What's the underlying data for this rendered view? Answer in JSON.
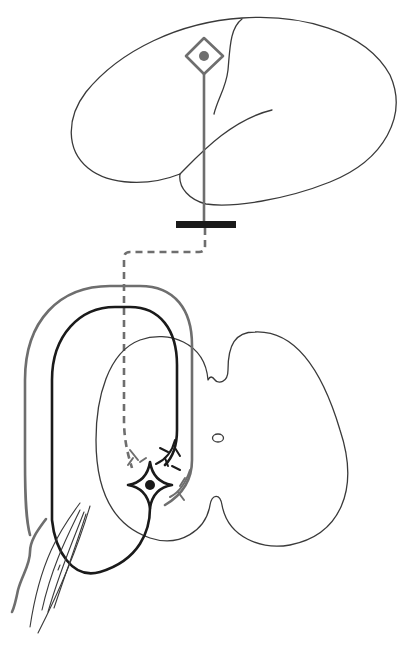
{
  "figure": {
    "description": "Schematic of motor pathway: upper motor neuron in brain, descending tract through synapse bar, spinal cord cross-section with lower motor neuron, sensory loop, and muscle",
    "colors": {
      "outline": "#3a3a3a",
      "gray_pathway": "#6e6e6e",
      "black_pathway": "#1a1a1a",
      "synapse_bar": "#1a1a1a",
      "background": "#ffffff"
    }
  },
  "elements": {
    "brain": {
      "label": "brain-outline"
    },
    "upper_neuron": {
      "label": "upper-motor-neuron",
      "shape": "diamond"
    },
    "descending_axon": {
      "label": "descending-axon"
    },
    "synapse_bar": {
      "label": "decussation-bar"
    },
    "dashed_tract": {
      "label": "dashed-descending-tract"
    },
    "spinal_cord": {
      "label": "spinal-cord-cross-section"
    },
    "central_canal": {
      "label": "central-canal"
    },
    "lower_neuron": {
      "label": "lower-motor-neuron",
      "shape": "star"
    },
    "gray_loop": {
      "label": "sensory-afferent-loop"
    },
    "black_loop": {
      "label": "motor-efferent-loop"
    },
    "muscle": {
      "label": "muscle-fibers"
    },
    "nerve": {
      "label": "peripheral-nerve"
    }
  }
}
